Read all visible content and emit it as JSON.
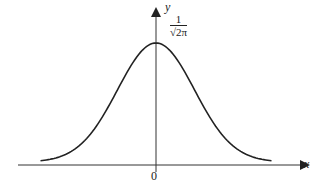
{
  "chart_data": {
    "type": "line",
    "title": "",
    "xlabel": "x",
    "ylabel": "y",
    "x_tick_labels": [
      "0"
    ],
    "annotations": [
      {
        "text": "1/√(2π)",
        "position": "peak on y-axis",
        "numerator": "1",
        "denominator": "√2π"
      }
    ],
    "series": [
      {
        "name": "standard normal density",
        "function": "y = (1/√(2π)) e^(-x²/2)",
        "x": [
          -3,
          -2,
          -1,
          0,
          1,
          2,
          3
        ],
        "values": [
          0.004,
          0.054,
          0.242,
          0.399,
          0.242,
          0.054,
          0.004
        ]
      }
    ],
    "xlim": [
      -3.3,
      3.3
    ],
    "ylim": [
      0,
      0.45
    ],
    "grid": false,
    "legend": "none"
  },
  "labels": {
    "x_axis": "x",
    "y_axis": "y",
    "origin": "0",
    "peak_num": "1",
    "peak_den": "√2π"
  },
  "colors": {
    "curve": "#222222",
    "axes": "#333333"
  }
}
